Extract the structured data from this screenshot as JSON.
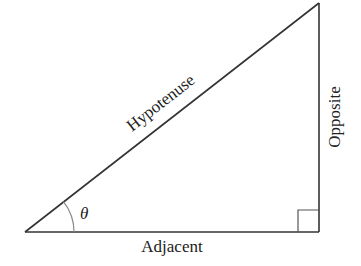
{
  "diagram": {
    "type": "right-triangle",
    "labels": {
      "hypotenuse": "Hypotenuse",
      "opposite": "Opposite",
      "adjacent": "Adjacent",
      "angle": "θ"
    },
    "colors": {
      "stroke": "#333333",
      "arc": "#888888",
      "text": "#222222"
    }
  }
}
